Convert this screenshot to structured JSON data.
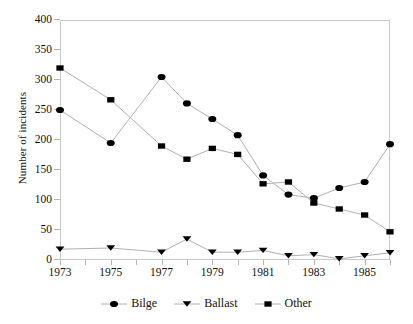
{
  "chart_data": {
    "type": "line",
    "title": "",
    "xlabel": "",
    "ylabel": "Number of incidents",
    "x": [
      1973,
      1975,
      1977,
      1978,
      1979,
      1980,
      1981,
      1982,
      1983,
      1984,
      1985,
      1986
    ],
    "xlim": [
      1973,
      1986
    ],
    "ylim": [
      0,
      400
    ],
    "y_ticks": [
      0,
      50,
      100,
      150,
      200,
      250,
      300,
      350,
      400
    ],
    "x_ticks": [
      1973,
      1974,
      1975,
      1976,
      1977,
      1978,
      1979,
      1980,
      1981,
      1982,
      1983,
      1984,
      1985,
      1986
    ],
    "x_tick_labels": [
      "1973",
      "",
      "1975",
      "",
      "1977",
      "",
      "1979",
      "",
      "1981",
      "",
      "1983",
      "",
      "1985",
      ""
    ],
    "grid": false,
    "legend_position": "bottom",
    "series": [
      {
        "name": "Bilge",
        "marker": "circle",
        "color": "#000000",
        "line_color": "#b0b0b0",
        "values": [
          250,
          195,
          305,
          261,
          235,
          208,
          141,
          109,
          103,
          120,
          130,
          193
        ]
      },
      {
        "name": "Ballast",
        "marker": "triangle-down",
        "color": "#000000",
        "line_color": "#b0b0b0",
        "values": [
          18,
          20,
          13,
          35,
          13,
          13,
          16,
          7,
          9,
          2,
          7,
          12
        ]
      },
      {
        "name": "Other",
        "marker": "square",
        "color": "#000000",
        "line_color": "#b0b0b0",
        "values": [
          320,
          267,
          190,
          168,
          186,
          176,
          127,
          130,
          95,
          85,
          75,
          47
        ]
      }
    ]
  },
  "legend": {
    "items": [
      {
        "label": "Bilge",
        "marker": "circle-marker-icon"
      },
      {
        "label": "Ballast",
        "marker": "triangle-marker-icon"
      },
      {
        "label": "Other",
        "marker": "square-marker-icon"
      }
    ]
  },
  "axes": {
    "y_title": "Number of incidents"
  }
}
